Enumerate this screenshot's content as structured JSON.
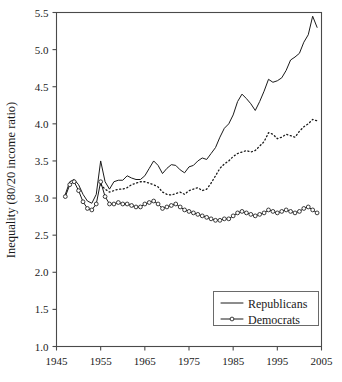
{
  "chart_data": {
    "type": "line",
    "title": "",
    "xlabel": "",
    "ylabel": "Inequality (80/20 income ratio)",
    "xlim": [
      1945,
      2005
    ],
    "ylim": [
      1.0,
      5.5
    ],
    "xticks": [
      1945,
      1955,
      1965,
      1975,
      1985,
      1995,
      2005
    ],
    "yticks": [
      1.0,
      1.5,
      2.0,
      2.5,
      3.0,
      3.5,
      4.0,
      4.5,
      5.0,
      5.5
    ],
    "grid": false,
    "legend_position": "bottom-right",
    "series": [
      {
        "name": "Republicans",
        "style": "solid",
        "marker": "none",
        "color": "#1a1a1a",
        "x": [
          1947,
          1948,
          1949,
          1950,
          1951,
          1952,
          1953,
          1954,
          1955,
          1956,
          1957,
          1958,
          1959,
          1960,
          1961,
          1962,
          1963,
          1964,
          1965,
          1966,
          1967,
          1968,
          1969,
          1970,
          1971,
          1972,
          1973,
          1974,
          1975,
          1976,
          1977,
          1978,
          1979,
          1980,
          1981,
          1982,
          1983,
          1984,
          1985,
          1986,
          1987,
          1988,
          1989,
          1990,
          1991,
          1992,
          1993,
          1994,
          1995,
          1996,
          1997,
          1998,
          1999,
          2000,
          2001,
          2002,
          2003,
          2004
        ],
        "values": [
          3.05,
          3.22,
          3.25,
          3.18,
          3.05,
          2.96,
          2.93,
          3.05,
          3.5,
          3.22,
          3.12,
          3.22,
          3.24,
          3.24,
          3.3,
          3.27,
          3.25,
          3.25,
          3.3,
          3.4,
          3.5,
          3.44,
          3.33,
          3.4,
          3.45,
          3.44,
          3.38,
          3.34,
          3.42,
          3.44,
          3.5,
          3.54,
          3.52,
          3.6,
          3.68,
          3.82,
          3.94,
          4.0,
          4.12,
          4.3,
          4.4,
          4.34,
          4.27,
          4.18,
          4.3,
          4.44,
          4.6,
          4.56,
          4.58,
          4.62,
          4.72,
          4.86,
          4.9,
          4.95,
          5.1,
          5.2,
          5.45,
          5.3
        ]
      },
      {
        "name": "Middle",
        "style": "dotted",
        "marker": "none",
        "color": "#1a1a1a",
        "x": [
          1955,
          1956,
          1957,
          1958,
          1959,
          1960,
          1961,
          1962,
          1963,
          1964,
          1965,
          1966,
          1967,
          1968,
          1969,
          1970,
          1971,
          1972,
          1973,
          1974,
          1975,
          1976,
          1977,
          1978,
          1979,
          1980,
          1981,
          1982,
          1983,
          1984,
          1985,
          1986,
          1987,
          1988,
          1989,
          1990,
          1991,
          1992,
          1993,
          1994,
          1995,
          1996,
          1997,
          1998,
          1999,
          2000,
          2001,
          2002,
          2003,
          2004
        ],
        "values": [
          3.18,
          3.12,
          3.08,
          3.1,
          3.12,
          3.12,
          3.14,
          3.18,
          3.2,
          3.22,
          3.22,
          3.2,
          3.18,
          3.15,
          3.08,
          3.05,
          3.04,
          3.06,
          3.08,
          3.05,
          3.1,
          3.12,
          3.14,
          3.1,
          3.12,
          3.2,
          3.3,
          3.4,
          3.46,
          3.5,
          3.56,
          3.6,
          3.62,
          3.64,
          3.62,
          3.64,
          3.7,
          3.76,
          3.88,
          3.86,
          3.8,
          3.82,
          3.86,
          3.84,
          3.82,
          3.9,
          3.96,
          4.0,
          4.06,
          4.04
        ]
      },
      {
        "name": "Democrats",
        "style": "solid",
        "marker": "circle",
        "color": "#1a1a1a",
        "x": [
          1947,
          1948,
          1949,
          1950,
          1951,
          1952,
          1953,
          1954,
          1955,
          1956,
          1957,
          1958,
          1959,
          1960,
          1961,
          1962,
          1963,
          1964,
          1965,
          1966,
          1967,
          1968,
          1969,
          1970,
          1971,
          1972,
          1973,
          1974,
          1975,
          1976,
          1977,
          1978,
          1979,
          1980,
          1981,
          1982,
          1983,
          1984,
          1985,
          1986,
          1987,
          1988,
          1989,
          1990,
          1991,
          1992,
          1993,
          1994,
          1995,
          1996,
          1997,
          1998,
          1999,
          2000,
          2001,
          2002,
          2003,
          2004
        ],
        "values": [
          3.02,
          3.18,
          3.22,
          3.1,
          2.95,
          2.86,
          2.84,
          2.92,
          3.22,
          3.02,
          2.92,
          2.92,
          2.94,
          2.92,
          2.92,
          2.9,
          2.88,
          2.88,
          2.92,
          2.94,
          2.96,
          2.92,
          2.86,
          2.88,
          2.9,
          2.92,
          2.88,
          2.84,
          2.82,
          2.8,
          2.78,
          2.76,
          2.74,
          2.72,
          2.7,
          2.7,
          2.72,
          2.72,
          2.76,
          2.8,
          2.82,
          2.8,
          2.78,
          2.76,
          2.78,
          2.8,
          2.84,
          2.82,
          2.8,
          2.82,
          2.84,
          2.82,
          2.8,
          2.82,
          2.86,
          2.88,
          2.84,
          2.8
        ]
      }
    ],
    "legend": [
      {
        "label": "Republicans",
        "style": "solid",
        "marker": "none"
      },
      {
        "label": "Democrats",
        "style": "solid",
        "marker": "circle"
      }
    ]
  }
}
